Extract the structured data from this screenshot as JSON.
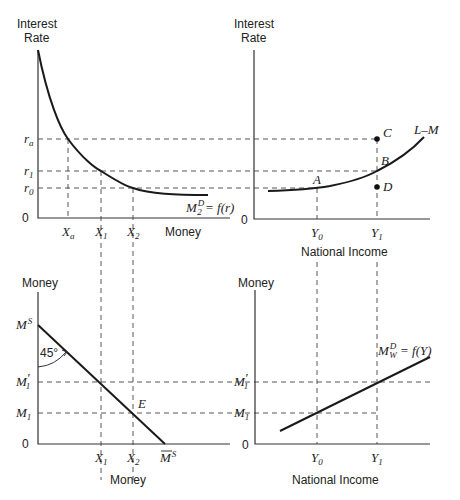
{
  "panels": {
    "top_left": {
      "y_axis_label_line1": "Interest",
      "y_axis_label_line2": "Rate",
      "x_axis_label": "Money",
      "origin": "0",
      "y_ticks": [
        {
          "main": "r",
          "sub": "a"
        },
        {
          "main": "r",
          "sub": "1"
        },
        {
          "main": "r",
          "sub": "0"
        }
      ],
      "x_ticks": [
        {
          "main": "X",
          "sub": "a"
        },
        {
          "main": "X",
          "sub": "1"
        },
        {
          "main": "X",
          "sub": "2"
        }
      ],
      "curve_label": {
        "main": "M",
        "sup": "D",
        "sub": "2",
        "rest": " = f(r)"
      }
    },
    "top_right": {
      "y_axis_label_line1": "Interest",
      "y_axis_label_line2": "Rate",
      "x_axis_label": "National Income",
      "origin": "0",
      "x_ticks": [
        {
          "main": "Y",
          "sub": "0"
        },
        {
          "main": "Y",
          "sub": "1"
        }
      ],
      "curve_label": "L–M",
      "points": [
        "A",
        "B",
        "C",
        "D"
      ]
    },
    "bottom_left": {
      "y_axis_label": "Money",
      "x_axis_label": "Money",
      "origin": "0",
      "y_ticks": [
        {
          "main": "M",
          "sup": "S"
        },
        {
          "main": "M",
          "sub": "1",
          "prime": "′"
        },
        {
          "main": "M",
          "sub": "1"
        }
      ],
      "x_ticks": [
        {
          "main": "X",
          "sub": "1"
        },
        {
          "main": "X",
          "sub": "2"
        },
        {
          "main": "M",
          "sup": "S",
          "bar": true
        }
      ],
      "angle_label": "45°",
      "point": "E"
    },
    "bottom_right": {
      "y_axis_label": "Money",
      "x_axis_label": "National Income",
      "origin": "0",
      "y_ticks": [
        {
          "main": "M",
          "sub": "1",
          "prime": "′"
        },
        {
          "main": "M",
          "sub": "1"
        }
      ],
      "x_ticks": [
        {
          "main": "Y",
          "sub": "0"
        },
        {
          "main": "Y",
          "sub": "1"
        }
      ],
      "curve_label": {
        "main": "M",
        "sup": "D",
        "sub": "W",
        "rest": " = f(Y)"
      }
    }
  }
}
